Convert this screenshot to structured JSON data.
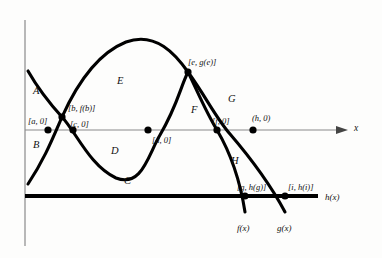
{
  "figure": {
    "type": "math-graph",
    "colors": {
      "curve": "#000000",
      "axis": "#8a8a8a",
      "baseline": "#000000",
      "text": "#111111",
      "background": "#fdfdfc"
    }
  },
  "axes": {
    "x_axis_label": "x",
    "x_axis_y": 130,
    "y_axis_x": 25,
    "x_axis_start": 25,
    "x_axis_end": 340,
    "y_axis_top": 20,
    "y_axis_bottom": 246
  },
  "baseline": {
    "label": "h(x)",
    "y": 196,
    "x_start": 25,
    "x_end": 318
  },
  "curve_labels": [
    {
      "name": "f-curve-label",
      "text": "f(x)",
      "x": 237,
      "y": 224
    },
    {
      "name": "g-curve-label",
      "text": "g(x)",
      "x": 277,
      "y": 224
    },
    {
      "name": "h-curve-label",
      "text": "h(x)",
      "x": 325,
      "y": 193
    }
  ],
  "regions": [
    {
      "name": "region-A",
      "text": "A",
      "x": 33,
      "y": 86
    },
    {
      "name": "region-B",
      "text": "B",
      "x": 33,
      "y": 140
    },
    {
      "name": "region-C",
      "text": "C",
      "x": 124,
      "y": 176
    },
    {
      "name": "region-D",
      "text": "D",
      "x": 111,
      "y": 146
    },
    {
      "name": "region-E",
      "text": "E",
      "x": 117,
      "y": 76
    },
    {
      "name": "region-F",
      "text": "F",
      "x": 191,
      "y": 105
    },
    {
      "name": "region-G",
      "text": "G",
      "x": 228,
      "y": 94
    },
    {
      "name": "region-H",
      "text": "H",
      "x": 231,
      "y": 156
    }
  ],
  "points": [
    {
      "name": "point-a",
      "text": "[a, 0]",
      "x": 28,
      "y": 117,
      "dot_x": 48,
      "dot_y": 130
    },
    {
      "name": "point-b",
      "text": "[b, f(b)]",
      "x": 68,
      "y": 104,
      "dot_x": 62,
      "dot_y": 117
    },
    {
      "name": "point-c",
      "text": "[c, 0]",
      "x": 70,
      "y": 120,
      "dot_x": 73,
      "dot_y": 130
    },
    {
      "name": "point-d",
      "text": "[d, 0]",
      "x": 152,
      "y": 136,
      "dot_x": 148,
      "dot_y": 130
    },
    {
      "name": "point-e",
      "text": "[e, g(e)]",
      "x": 188,
      "y": 58,
      "dot_x": 188,
      "dot_y": 72
    },
    {
      "name": "point-f",
      "text": "[f, 0]",
      "x": 212,
      "y": 117,
      "dot_x": 217,
      "dot_y": 130
    },
    {
      "name": "point-h",
      "text": "(h, 0)",
      "x": 252,
      "y": 114,
      "dot_x": 253,
      "dot_y": 130
    },
    {
      "name": "point-g",
      "text": "[g, h(g)]",
      "x": 237,
      "y": 183,
      "dot_x": 245,
      "dot_y": 196
    },
    {
      "name": "point-i",
      "text": "[i, h(i)]",
      "x": 288,
      "y": 183,
      "dot_x": 285,
      "dot_y": 196
    }
  ],
  "curves": {
    "f_path": "M 28 71 C 40 92, 52 106, 62 117 C 76 132, 90 166, 116 178 C 142 188, 148 155, 160 135 C 178 104, 180 88, 188 72 C 196 88, 205 110, 217 130 C 230 152, 240 180, 245 212",
    "g_path": "M 28 184 C 44 160, 52 140, 62 117 C 76 86, 96 54, 126 42 C 156 31, 176 55, 188 72 C 206 97, 216 118, 230 134 C 248 155, 268 180, 285 212"
  }
}
